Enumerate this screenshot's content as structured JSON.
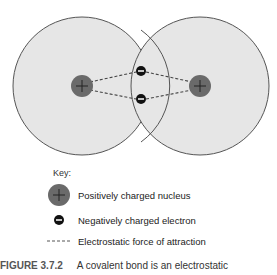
{
  "diagram": {
    "atoms": [
      {
        "id": "left",
        "cx": 82,
        "cy": 86,
        "r": 69
      },
      {
        "id": "right",
        "cx": 200,
        "cy": 86,
        "r": 69
      }
    ],
    "nuclei_symbol": "+",
    "electron_symbol": "−",
    "colors": {
      "atom_fill": "#e6e6e6",
      "atom_stroke": "#555555",
      "nucleus": "#6a6a6a",
      "electron": "#111111",
      "dash": "#444444"
    }
  },
  "key": {
    "title": "Key:",
    "items": [
      {
        "symbol": "nucleus",
        "label": "Positively charged nucleus"
      },
      {
        "symbol": "electron",
        "label": "Negatively charged electron"
      },
      {
        "symbol": "dashed-line",
        "label": "Electrostatic force of attraction"
      }
    ]
  },
  "caption": {
    "figure": "FIGURE 3.7.2",
    "text": "A covalent bond is an electrostatic"
  }
}
